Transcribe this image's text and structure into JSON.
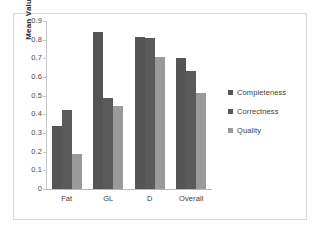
{
  "chart_data": {
    "type": "bar",
    "title": "",
    "xlabel": "",
    "ylabel": "Mean Value",
    "ylim": [
      0,
      0.9
    ],
    "yticks": [
      "0.9",
      "0.8",
      "0.7",
      "0.6",
      "0.5",
      "0.4",
      "0.3",
      "0.2",
      "0.1",
      "0"
    ],
    "ytick_values": [
      0.9,
      0.8,
      0.7,
      0.6,
      0.5,
      0.4,
      0.3,
      0.2,
      0.1,
      0
    ],
    "grid": false,
    "legend_position": "right",
    "categories": [
      "Fat",
      "GL",
      "D",
      "Overall"
    ],
    "series": [
      {
        "name": "Completeness",
        "color": "#555555",
        "values": [
          0.335,
          0.84,
          0.815,
          0.7
        ]
      },
      {
        "name": "Correctness",
        "color": "#5a5a5a",
        "values": [
          0.425,
          0.49,
          0.81,
          0.63
        ]
      },
      {
        "name": "Quality",
        "color": "#9a9a9a",
        "values": [
          0.19,
          0.445,
          0.705,
          0.515
        ]
      }
    ]
  }
}
